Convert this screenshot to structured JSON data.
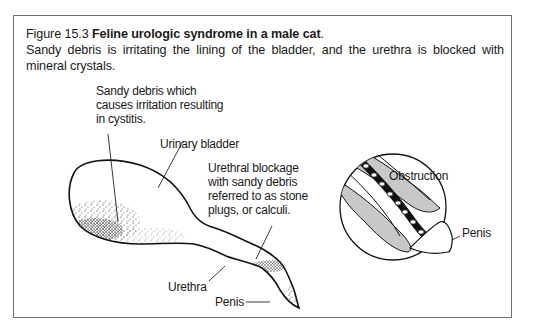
{
  "figure": {
    "number": "Figure 15.3",
    "title": "Feline urologic syndrome in a male cat",
    "title_end": ".",
    "description": "Sandy debris is irritating the lining of the bladder, and the urethra is blocked with mineral crystals."
  },
  "labels": {
    "sandy_debris": "Sandy debris which\ncauses irritation resulting\nin cystitis.",
    "urinary_bladder": "Urinary bladder",
    "urethral_blockage": "Urethral blockage\nwith sandy debris\nreferred to as stone\nplugs, or calculi.",
    "urethra": "Urethra",
    "penis_main": "Penis",
    "obstruction": "Obstruction",
    "penis_inset": "Penis"
  }
}
